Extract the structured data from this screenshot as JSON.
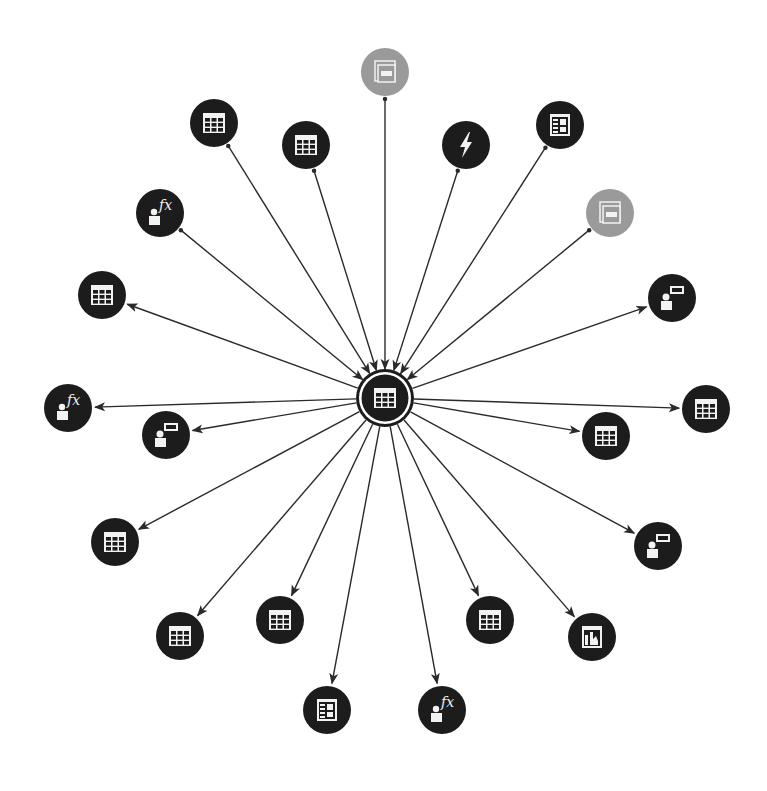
{
  "diagram": {
    "type": "dependency-graph",
    "layout": "radial",
    "colors": {
      "node": "#1c1c1c",
      "node_muted": "#9a9a9a",
      "edge": "#2a2a2a",
      "icon": "#f2f2f2",
      "background": "#ffffff"
    },
    "center": {
      "id": "center",
      "icon": "table-icon",
      "x": 385,
      "y": 398,
      "r": 25
    },
    "nodes": [
      {
        "id": "n1",
        "icon": "view-icon",
        "muted": true,
        "x": 385,
        "y": 72,
        "direction": "in"
      },
      {
        "id": "n2",
        "icon": "table-icon",
        "muted": false,
        "x": 214,
        "y": 123,
        "direction": "in"
      },
      {
        "id": "n3",
        "icon": "table-icon",
        "muted": false,
        "x": 306,
        "y": 145,
        "direction": "in"
      },
      {
        "id": "n4",
        "icon": "lightning-icon",
        "muted": false,
        "x": 466,
        "y": 145,
        "direction": "in"
      },
      {
        "id": "n5",
        "icon": "report-icon",
        "muted": false,
        "x": 560,
        "y": 125,
        "direction": "in"
      },
      {
        "id": "n6",
        "icon": "user-function-icon",
        "muted": false,
        "x": 160,
        "y": 213,
        "direction": "in"
      },
      {
        "id": "n7",
        "icon": "view-icon",
        "muted": true,
        "x": 610,
        "y": 213,
        "direction": "in"
      },
      {
        "id": "n8",
        "icon": "table-icon",
        "muted": false,
        "x": 102,
        "y": 295,
        "direction": "out"
      },
      {
        "id": "n9",
        "icon": "user-label-icon",
        "muted": false,
        "x": 672,
        "y": 298,
        "direction": "out"
      },
      {
        "id": "n10",
        "icon": "user-function-icon",
        "muted": false,
        "x": 68,
        "y": 408,
        "direction": "out"
      },
      {
        "id": "n11",
        "icon": "user-label-icon",
        "muted": false,
        "x": 166,
        "y": 435,
        "direction": "out"
      },
      {
        "id": "n12",
        "icon": "table-icon",
        "muted": false,
        "x": 706,
        "y": 409,
        "direction": "out"
      },
      {
        "id": "n13",
        "icon": "table-icon",
        "muted": false,
        "x": 606,
        "y": 436,
        "direction": "out"
      },
      {
        "id": "n14",
        "icon": "table-icon",
        "muted": false,
        "x": 115,
        "y": 542,
        "direction": "out"
      },
      {
        "id": "n15",
        "icon": "user-label-icon",
        "muted": false,
        "x": 658,
        "y": 546,
        "direction": "out"
      },
      {
        "id": "n16",
        "icon": "table-icon",
        "muted": false,
        "x": 180,
        "y": 636,
        "direction": "out"
      },
      {
        "id": "n17",
        "icon": "table-icon",
        "muted": false,
        "x": 280,
        "y": 620,
        "direction": "out"
      },
      {
        "id": "n18",
        "icon": "report-icon",
        "muted": false,
        "x": 327,
        "y": 710,
        "direction": "out"
      },
      {
        "id": "n19",
        "icon": "user-function-icon",
        "muted": false,
        "x": 442,
        "y": 710,
        "direction": "out"
      },
      {
        "id": "n20",
        "icon": "table-icon",
        "muted": false,
        "x": 490,
        "y": 620,
        "direction": "out"
      },
      {
        "id": "n21",
        "icon": "chart-report-icon",
        "muted": false,
        "x": 592,
        "y": 637,
        "direction": "out"
      }
    ],
    "node_radius": 24,
    "icon_text": {
      "fx": "fx"
    }
  }
}
